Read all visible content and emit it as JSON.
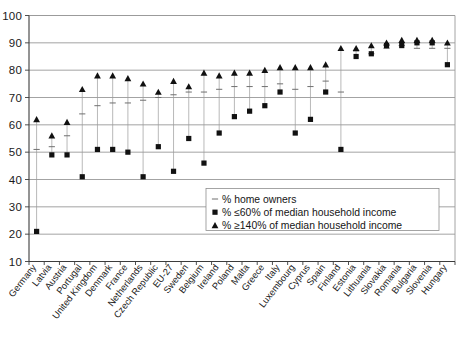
{
  "chart_data": {
    "type": "scatter",
    "title": "",
    "subtitle": "",
    "xlabel": "",
    "ylabel": "",
    "ylim": [
      10,
      100
    ],
    "ytick_step": 10,
    "yticks": [
      10,
      20,
      30,
      40,
      50,
      60,
      70,
      80,
      90,
      100
    ],
    "grid": true,
    "legend_position": "inside-lower-right",
    "categories": [
      "Germany",
      "Latvia",
      "Austria",
      "Portugal",
      "United Kingdom",
      "Denmark",
      "France",
      "Netherlands",
      "Czech Republic",
      "EU-27",
      "Sweden",
      "Belgium",
      "Ireland",
      "Poland",
      "Malta",
      "Greece",
      "Italy",
      "Luxembourg",
      "Cyprus",
      "Spain",
      "Finland",
      "Estonia",
      "Lithuania",
      "Slovakia",
      "Romania",
      "Bulgaria",
      "Slovenia",
      "Hungary"
    ],
    "series": [
      {
        "name": "% home owners",
        "marker": "dash",
        "values": [
          51,
          52,
          56,
          64,
          67,
          68,
          68,
          69,
          70,
          71,
          72,
          72,
          73,
          74,
          74,
          74,
          75,
          73,
          74,
          76,
          72,
          87,
          86,
          88,
          89,
          88,
          88,
          88
        ]
      },
      {
        "name": "% ≤60% of median household income",
        "marker": "square",
        "values": [
          21,
          49,
          49,
          41,
          51,
          51,
          50,
          41,
          52,
          43,
          55,
          46,
          57,
          63,
          65,
          67,
          72,
          57,
          62,
          72,
          51,
          85,
          86,
          89,
          89,
          90,
          90,
          82
        ]
      },
      {
        "name": "% ≥140% of median household income",
        "marker": "triangle",
        "values": [
          62,
          56,
          61,
          73,
          78,
          78,
          77,
          75,
          72,
          76,
          74,
          79,
          78,
          79,
          79,
          80,
          81,
          81,
          81,
          82,
          88,
          88,
          89,
          90,
          91,
          91,
          91,
          90
        ]
      }
    ]
  },
  "legend": {
    "entries": [
      {
        "label": "% home owners",
        "marker": "dash"
      },
      {
        "label": "% ≤60% of median household income",
        "marker": "square"
      },
      {
        "label": "% ≥140% of median household income",
        "marker": "triangle"
      }
    ]
  },
  "colors": {
    "marker": "#111111",
    "gridline": "#8c8c8c",
    "axis": "#3c3c3c",
    "connector": "#9b9b9b",
    "background": "#ffffff",
    "text": "#1a1a1a"
  }
}
